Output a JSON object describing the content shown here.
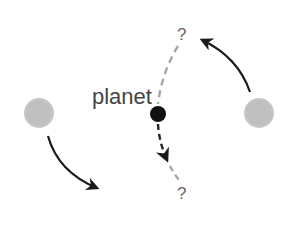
{
  "diagram": {
    "planet_label": "planet",
    "question_top": "?",
    "question_bottom": "?",
    "elements": {
      "left_star": {
        "cx": 39,
        "cy": 113,
        "r": 15,
        "color": "#c4c4c4"
      },
      "right_star": {
        "cx": 259,
        "cy": 113,
        "r": 15,
        "color": "#c4c4c4"
      },
      "planet": {
        "cx": 158,
        "cy": 114,
        "r": 8,
        "color": "#111111"
      }
    },
    "colors": {
      "arrow": "#1a1a1a",
      "dashed_path_gray": "#a6a6a6",
      "dashed_path_dark": "#222222",
      "label_text": "#444444",
      "question_text": "#666666"
    }
  }
}
